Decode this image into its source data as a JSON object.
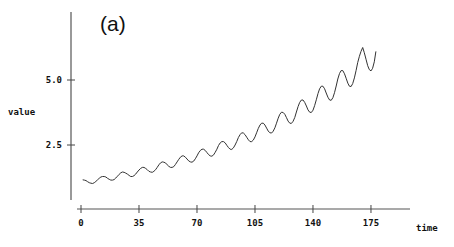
{
  "chart_data": {
    "type": "line",
    "title": "(a)",
    "xlabel": "time",
    "ylabel": "value",
    "xticks": [
      0,
      35,
      70,
      105,
      140,
      175
    ],
    "xtick_labels": [
      "0",
      "35",
      "70",
      "105",
      "140",
      "175"
    ],
    "yticks": [
      2.5,
      5.0
    ],
    "ytick_labels": [
      "2.5",
      "5.0"
    ],
    "xlim": [
      0,
      198
    ],
    "ylim": [
      0,
      7.2
    ],
    "grid": false,
    "legend": null,
    "series": [
      {
        "name": "value",
        "color": "#333333",
        "x_start": 1,
        "values": [
          1.16,
          1.15,
          1.13,
          1.09,
          1.05,
          1.03,
          1.02,
          1.05,
          1.1,
          1.16,
          1.22,
          1.27,
          1.29,
          1.29,
          1.27,
          1.22,
          1.18,
          1.15,
          1.15,
          1.17,
          1.23,
          1.3,
          1.37,
          1.43,
          1.46,
          1.45,
          1.42,
          1.38,
          1.33,
          1.29,
          1.29,
          1.32,
          1.38,
          1.46,
          1.54,
          1.6,
          1.64,
          1.64,
          1.6,
          1.55,
          1.49,
          1.46,
          1.45,
          1.49,
          1.55,
          1.64,
          1.74,
          1.81,
          1.85,
          1.84,
          1.81,
          1.74,
          1.68,
          1.64,
          1.64,
          1.67,
          1.75,
          1.85,
          1.95,
          2.03,
          2.08,
          2.08,
          2.03,
          1.96,
          1.89,
          1.85,
          1.84,
          1.88,
          1.97,
          2.08,
          2.2,
          2.29,
          2.34,
          2.34,
          2.29,
          2.21,
          2.13,
          2.08,
          2.07,
          2.12,
          2.22,
          2.34,
          2.48,
          2.58,
          2.63,
          2.63,
          2.58,
          2.49,
          2.4,
          2.34,
          2.33,
          2.39,
          2.5,
          2.64,
          2.79,
          2.9,
          2.97,
          2.96,
          2.9,
          2.8,
          2.7,
          2.63,
          2.63,
          2.69,
          2.81,
          2.97,
          3.14,
          3.27,
          3.34,
          3.34,
          3.27,
          3.15,
          3.04,
          2.97,
          2.96,
          3.03,
          3.16,
          3.34,
          3.53,
          3.68,
          3.76,
          3.75,
          3.68,
          3.55,
          3.42,
          3.34,
          3.33,
          3.41,
          3.56,
          3.77,
          3.98,
          4.14,
          4.23,
          4.23,
          4.14,
          4.0,
          3.85,
          3.76,
          3.75,
          3.84,
          4.01,
          4.24,
          4.48,
          4.66,
          4.76,
          4.76,
          4.66,
          4.5,
          4.34,
          4.23,
          4.22,
          4.32,
          4.51,
          4.77,
          5.04,
          5.25,
          5.36,
          5.36,
          5.24,
          5.07,
          4.88,
          4.76,
          4.75,
          4.86,
          5.08,
          5.37,
          5.67,
          5.91,
          6.1,
          6.25,
          6.05,
          5.8,
          5.55,
          5.4,
          5.35,
          5.45,
          5.7,
          6.1
        ]
      }
    ]
  },
  "labels": {
    "panel": "(a)",
    "xlabel": "time",
    "ylabel": "value"
  }
}
